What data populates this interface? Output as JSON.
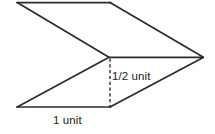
{
  "figure": {
    "background_color": "#ffffff",
    "stroke_color": "#2b2b2b",
    "dashed_stroke_color": "#3a3a3a",
    "label_color": "#222222",
    "labels": {
      "height_label": "1/2 unit",
      "width_label": "1 unit"
    },
    "geometry": {
      "top_left": [
        17,
        2
      ],
      "top_right": [
        110,
        2
      ],
      "right_apex": [
        203,
        57
      ],
      "middle_notch": [
        108,
        57
      ],
      "bottom_left": [
        17,
        107
      ],
      "bottom_right": [
        110,
        107
      ],
      "dashed_line": [
        [
          110,
          58
        ],
        [
          110,
          106
        ]
      ],
      "upper_face_path": "M17,2 L110,2 L203,57 L108,57 Z",
      "lower_face_path": "M108,57 L203,57 L110,107 L17,107 Z",
      "middle_horizontal": [
        [
          110,
          57
        ],
        [
          203,
          57
        ]
      ]
    }
  }
}
